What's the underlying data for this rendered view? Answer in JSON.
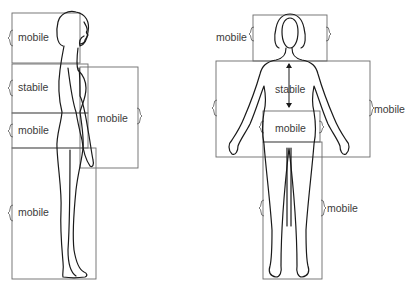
{
  "diagram": {
    "type": "body-segment-illustration",
    "colors": {
      "line": "#1a1a1a",
      "box": "#6a6a6a",
      "text": "#3a3a3a",
      "background": "#ffffff"
    },
    "side_view": {
      "labels": {
        "head": "mobile",
        "torso": "stabile",
        "hips": "mobile",
        "legs": "mobile",
        "arm": "mobile"
      }
    },
    "front_view": {
      "labels": {
        "head": "mobile",
        "torso": "stabile",
        "hips": "mobile",
        "arms": "mobile",
        "legs": "mobile"
      }
    }
  }
}
